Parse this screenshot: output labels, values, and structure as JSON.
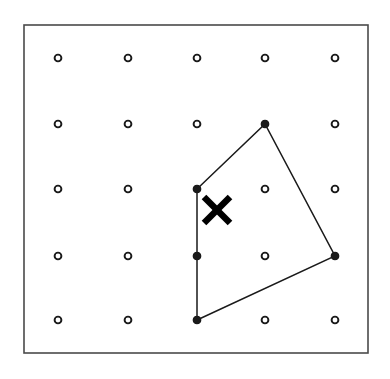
{
  "figure": {
    "title": "Geoboard dot grid with quadrilateral and X mark",
    "type": "geometry-dot-grid",
    "background_color": "#ffffff",
    "ink_color": "#1a1a1a",
    "border_color": "#4a4a4a"
  },
  "frame": {
    "name": "outer-border-rectangle",
    "x": 24,
    "y": 25,
    "width": 344,
    "height": 328,
    "stroke_width": 1.6,
    "fill": "none"
  },
  "grid": {
    "rows": 5,
    "columns": 5,
    "column_x": [
      58,
      128,
      197,
      265,
      335
    ],
    "row_y": [
      58,
      124,
      189,
      256,
      320
    ],
    "dot_outer_radius": 3.4,
    "dot_inner_radius": 1.5,
    "dot_stroke_color": "#1a1a1a",
    "dot_fill_color": "#ffffff",
    "points": [
      {
        "id": "p-1-1",
        "col": 1,
        "row": 1,
        "x": 58,
        "y": 58,
        "filled": false
      },
      {
        "id": "p-2-1",
        "col": 2,
        "row": 1,
        "x": 128,
        "y": 58,
        "filled": false
      },
      {
        "id": "p-3-1",
        "col": 3,
        "row": 1,
        "x": 197,
        "y": 58,
        "filled": false
      },
      {
        "id": "p-4-1",
        "col": 4,
        "row": 1,
        "x": 265,
        "y": 58,
        "filled": false
      },
      {
        "id": "p-5-1",
        "col": 5,
        "row": 1,
        "x": 335,
        "y": 58,
        "filled": false
      },
      {
        "id": "p-1-2",
        "col": 1,
        "row": 2,
        "x": 58,
        "y": 124,
        "filled": false
      },
      {
        "id": "p-2-2",
        "col": 2,
        "row": 2,
        "x": 128,
        "y": 124,
        "filled": false
      },
      {
        "id": "p-3-2",
        "col": 3,
        "row": 2,
        "x": 197,
        "y": 124,
        "filled": false
      },
      {
        "id": "p-4-2",
        "col": 4,
        "row": 2,
        "x": 265,
        "y": 124,
        "filled": true
      },
      {
        "id": "p-5-2",
        "col": 5,
        "row": 2,
        "x": 335,
        "y": 124,
        "filled": false
      },
      {
        "id": "p-1-3",
        "col": 1,
        "row": 3,
        "x": 58,
        "y": 189,
        "filled": false
      },
      {
        "id": "p-2-3",
        "col": 2,
        "row": 3,
        "x": 128,
        "y": 189,
        "filled": false
      },
      {
        "id": "p-3-3",
        "col": 3,
        "row": 3,
        "x": 197,
        "y": 189,
        "filled": true
      },
      {
        "id": "p-4-3",
        "col": 4,
        "row": 3,
        "x": 265,
        "y": 189,
        "filled": false
      },
      {
        "id": "p-5-3",
        "col": 5,
        "row": 3,
        "x": 335,
        "y": 189,
        "filled": false
      },
      {
        "id": "p-1-4",
        "col": 1,
        "row": 4,
        "x": 58,
        "y": 256,
        "filled": false
      },
      {
        "id": "p-2-4",
        "col": 2,
        "row": 4,
        "x": 128,
        "y": 256,
        "filled": false
      },
      {
        "id": "p-3-4",
        "col": 3,
        "row": 4,
        "x": 197,
        "y": 256,
        "filled": true
      },
      {
        "id": "p-4-4",
        "col": 4,
        "row": 4,
        "x": 265,
        "y": 256,
        "filled": false
      },
      {
        "id": "p-5-4",
        "col": 5,
        "row": 4,
        "x": 335,
        "y": 256,
        "filled": true
      },
      {
        "id": "p-1-5",
        "col": 1,
        "row": 5,
        "x": 58,
        "y": 320,
        "filled": false
      },
      {
        "id": "p-2-5",
        "col": 2,
        "row": 5,
        "x": 128,
        "y": 320,
        "filled": false
      },
      {
        "id": "p-3-5",
        "col": 3,
        "row": 5,
        "x": 197,
        "y": 320,
        "filled": true
      },
      {
        "id": "p-4-5",
        "col": 4,
        "row": 5,
        "x": 265,
        "y": 320,
        "filled": false
      },
      {
        "id": "p-5-5",
        "col": 5,
        "row": 5,
        "x": 335,
        "y": 320,
        "filled": false
      }
    ]
  },
  "polygon": {
    "name": "quadrilateral",
    "sides": 4,
    "stroke_color": "#1a1a1a",
    "stroke_width": 1.5,
    "fill": "none",
    "points_attr": "197,189 265,124 335,256 197,320",
    "vertices": [
      {
        "label": "A",
        "col": 3,
        "row": 3,
        "x": 197,
        "y": 189
      },
      {
        "label": "B",
        "col": 4,
        "row": 2,
        "x": 265,
        "y": 124
      },
      {
        "label": "C",
        "col": 5,
        "row": 4,
        "x": 335,
        "y": 256
      },
      {
        "label": "D",
        "col": 3,
        "row": 5,
        "x": 197,
        "y": 320
      }
    ],
    "edge_midpoint_marker": {
      "col": 3,
      "row": 4,
      "x": 197,
      "y": 256
    }
  },
  "mark": {
    "name": "x-mark",
    "glyph": "X",
    "center_x": 217,
    "center_y": 210,
    "arm_half": 13,
    "stroke_width": 6.5,
    "color": "#000000",
    "stroke_1": "204,197 230,223",
    "stroke_2": "230,197 204,223"
  }
}
